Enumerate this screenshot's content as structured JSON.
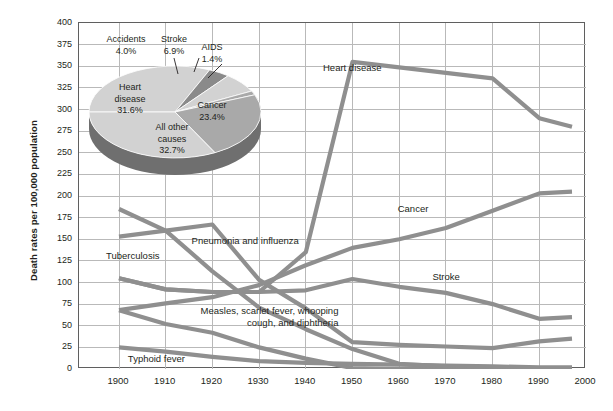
{
  "chart_data": {
    "type": "line",
    "title": "",
    "xlabel": "",
    "ylabel": "Death rates per 100,000 population",
    "xlim": [
      1900,
      2000
    ],
    "ylim": [
      0,
      400
    ],
    "xticks": [
      1900,
      1910,
      1920,
      1930,
      1940,
      1950,
      1960,
      1970,
      1980,
      1990,
      2000
    ],
    "yticks": [
      0,
      25,
      50,
      75,
      100,
      125,
      150,
      175,
      200,
      225,
      250,
      275,
      300,
      325,
      350,
      375,
      400
    ],
    "grid": true,
    "legend_position": "inline-labels",
    "series": [
      {
        "name": "Heart disease",
        "x": [
          1900,
          1910,
          1920,
          1930,
          1940,
          1950,
          1980,
          1990,
          1997
        ],
        "values": [
          105,
          92,
          89,
          89,
          135,
          355,
          336,
          290,
          280
        ]
      },
      {
        "name": "Cancer",
        "x": [
          1900,
          1910,
          1920,
          1930,
          1940,
          1950,
          1960,
          1970,
          1980,
          1990,
          1997
        ],
        "values": [
          68,
          76,
          83,
          97,
          120,
          140,
          150,
          163,
          183,
          203,
          205
        ]
      },
      {
        "name": "Stroke",
        "x": [
          1900,
          1910,
          1920,
          1930,
          1940,
          1950,
          1960,
          1970,
          1980,
          1990,
          1997
        ],
        "values": [
          105,
          92,
          89,
          89,
          91,
          104,
          95,
          88,
          75,
          58,
          60
        ]
      },
      {
        "name": "Pneumonia and influenza",
        "x": [
          1900,
          1910,
          1920,
          1930,
          1940,
          1950,
          1960,
          1970,
          1980,
          1990,
          1997
        ],
        "values": [
          153,
          160,
          167,
          103,
          70,
          31,
          28,
          26,
          24,
          32,
          35
        ]
      },
      {
        "name": "Tuberculosis",
        "x": [
          1900,
          1910,
          1920,
          1930,
          1940,
          1950,
          1960,
          1970,
          1980,
          1990,
          1997
        ],
        "values": [
          185,
          160,
          113,
          71,
          46,
          23,
          6,
          3,
          1,
          1,
          1
        ]
      },
      {
        "name": "Measles, scarlet fever, whooping cough, and diphtheria",
        "x": [
          1900,
          1910,
          1920,
          1930,
          1940,
          1950,
          1960,
          1970,
          1980,
          1990,
          1997
        ],
        "values": [
          68,
          52,
          42,
          25,
          12,
          1,
          0,
          0,
          0,
          0,
          0
        ]
      },
      {
        "name": "Typhoid fever",
        "x": [
          1900,
          1910,
          1920,
          1930,
          1940,
          1950,
          1960,
          1970,
          1980,
          1990,
          1997
        ],
        "values": [
          25,
          20,
          14,
          9,
          7,
          6,
          5,
          4,
          3,
          2,
          2
        ]
      }
    ],
    "line_labels": [
      {
        "text": "Heart disease",
        "x": 1950,
        "y": 348
      },
      {
        "text": "Cancer",
        "x": 1963,
        "y": 185
      },
      {
        "text": "Stroke",
        "x": 1970,
        "y": 107
      },
      {
        "text": "Pneumonia and influenza",
        "x": 1927,
        "y": 148
      },
      {
        "text": "Tuberculosis",
        "x": 1903,
        "y": 131
      },
      {
        "text": "Measles, scarlet fever, whooping cough, and diphtheria",
        "x": 1932,
        "y": 60
      },
      {
        "text": "Typhoid fever",
        "x": 1908,
        "y": 12
      }
    ],
    "inset_pie": {
      "type": "pie",
      "slices": [
        {
          "label": "Heart disease",
          "value": 31.6,
          "value_label": "31.6%"
        },
        {
          "label": "Cancer",
          "value": 23.4,
          "value_label": "23.4%"
        },
        {
          "label": "All other causes",
          "value": 32.7,
          "value_label": "32.7%"
        },
        {
          "label": "Accidents",
          "value": 4.0,
          "value_label": "4.0%"
        },
        {
          "label": "Stroke",
          "value": 6.9,
          "value_label": "6.9%"
        },
        {
          "label": "AIDS",
          "value": 1.4,
          "value_label": "1.4%"
        }
      ]
    },
    "colors": {
      "line": "#8f8f8f",
      "grid": "#b9b9b9",
      "frame": "#5f5f5f",
      "text": "#231f20",
      "pie_light": "#d2d2d2",
      "pie_mid": "#a9a9a9",
      "pie_dark": "#8a8a8a",
      "pie_side": "#6f6f6f"
    }
  }
}
